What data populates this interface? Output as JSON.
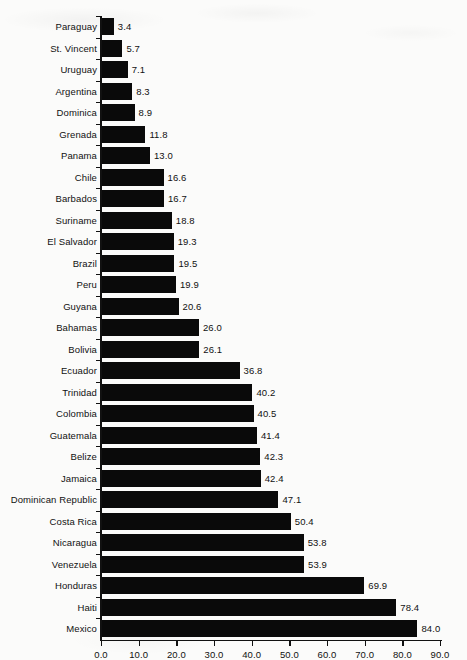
{
  "chart_data": {
    "type": "bar",
    "orientation": "horizontal",
    "title": "",
    "subtitle": "",
    "xlabel": "",
    "ylabel": "",
    "xlim": [
      0.0,
      90.0
    ],
    "xticks": [
      "0.0",
      "10.0",
      "20.0",
      "30.0",
      "40.0",
      "50.0",
      "60.0",
      "70.0",
      "80.0",
      "90.0"
    ],
    "xtick_values": [
      0,
      10,
      20,
      30,
      40,
      50,
      60,
      70,
      80,
      90
    ],
    "grid": false,
    "legend": null,
    "bar_color": "#0a0a0a",
    "background_color": "#fbfbfa",
    "categories": [
      "Paraguay",
      "St. Vincent",
      "Uruguay",
      "Argentina",
      "Dominica",
      "Grenada",
      "Panama",
      "Chile",
      "Barbados",
      "Suriname",
      "El Salvador",
      "Brazil",
      "Peru",
      "Guyana",
      "Bahamas",
      "Bolivia",
      "Ecuador",
      "Trinidad",
      "Colombia",
      "Guatemala",
      "Belize",
      "Jamaica",
      "Dominican Republic",
      "Costa Rica",
      "Nicaragua",
      "Venezuela",
      "Honduras",
      "Haiti",
      "Mexico"
    ],
    "values": [
      3.4,
      5.7,
      7.1,
      8.3,
      8.9,
      11.8,
      13.0,
      16.6,
      16.7,
      18.8,
      19.3,
      19.5,
      19.9,
      20.6,
      26.0,
      26.1,
      36.8,
      40.2,
      40.5,
      41.4,
      42.3,
      42.4,
      47.1,
      50.4,
      53.8,
      53.9,
      69.9,
      78.4,
      84.0
    ],
    "value_labels": [
      "3.4",
      "5.7",
      "7.1",
      "8.3",
      "8.9",
      "11.8",
      "13.0",
      "16.6",
      "16.7",
      "18.8",
      "19.3",
      "19.5",
      "19.9",
      "20.6",
      "26.0",
      "26.1",
      "36.8",
      "40.2",
      "40.5",
      "41.4",
      "42.3",
      "42.4",
      "47.1",
      "50.4",
      "53.8",
      "53.9",
      "69.9",
      "78.4",
      "84.0"
    ]
  }
}
